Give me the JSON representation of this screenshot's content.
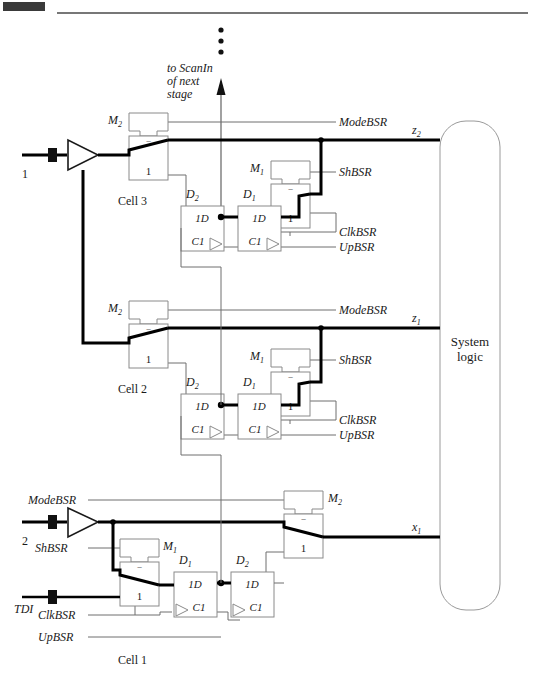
{
  "page": {
    "domain_note": "technical schematic"
  },
  "header_rule": {
    "present": true
  },
  "annotations": {
    "scan_out_line1": "to ScanIn",
    "scan_out_line2": "of next",
    "scan_out_line3": "stage",
    "vertical_ellipsis": "⋮"
  },
  "system_logic": {
    "label_line1": "System",
    "label_line2": "logic"
  },
  "cells": [
    {
      "id": "cell3",
      "name": "Cell 3",
      "input_pin": "1",
      "mux_out": {
        "label": "M",
        "sub": "2"
      },
      "mux_in": {
        "label": "M",
        "sub": "1"
      },
      "ff_far": {
        "label": "D",
        "sub": "2"
      },
      "ff_near": {
        "label": "D",
        "sub": "1"
      },
      "output_net": {
        "label": "z",
        "sub": "2"
      },
      "signals": [
        "ModeBSR",
        "ShBSR",
        "ClkBSR",
        "UpBSR"
      ],
      "mux_sel_top": "‾",
      "mux_sel_bot": "1",
      "ff_data_label": "1D",
      "ff_clk_label": "C1"
    },
    {
      "id": "cell2",
      "name": "Cell 2",
      "input_pin": "",
      "mux_out": {
        "label": "M",
        "sub": "2"
      },
      "mux_in": {
        "label": "M",
        "sub": "1"
      },
      "ff_far": {
        "label": "D",
        "sub": "2"
      },
      "ff_near": {
        "label": "D",
        "sub": "1"
      },
      "output_net": {
        "label": "z",
        "sub": "1"
      },
      "signals": [
        "ModeBSR",
        "ShBSR",
        "ClkBSR",
        "UpBSR"
      ],
      "mux_sel_top": "‾",
      "mux_sel_bot": "1",
      "ff_data_label": "1D",
      "ff_clk_label": "C1"
    },
    {
      "id": "cell1",
      "name": "Cell 1",
      "input_pin": "2",
      "scan_in_pin": "TDI",
      "mux_out": {
        "label": "M",
        "sub": "2"
      },
      "mux_in": {
        "label": "M",
        "sub": "1"
      },
      "ff_far": {
        "label": "D",
        "sub": "2"
      },
      "ff_near": {
        "label": "D",
        "sub": "1"
      },
      "output_net": {
        "label": "x",
        "sub": "1"
      },
      "signals": [
        "ModeBSR",
        "ShBSR",
        "ClkBSR",
        "UpBSR"
      ],
      "mux_sel_top": "‾",
      "mux_sel_bot": "1",
      "ff_data_label": "1D",
      "ff_clk_label": "C1"
    }
  ],
  "labels": {
    "mode_bsr": "ModeBSR",
    "sh_bsr": "ShBSR",
    "clk_bsr": "ClkBSR",
    "up_bsr": "UpBSR",
    "tdi": "TDI",
    "pin_1": "1",
    "pin_2": "2",
    "m1": "M",
    "m2": "M",
    "d1": "D",
    "d2": "D",
    "sub1": "1",
    "sub2": "2",
    "z1_base": "z",
    "z2_base": "z",
    "x1_base": "x",
    "cell1": "Cell 1",
    "cell2": "Cell 2",
    "cell3": "Cell 3",
    "one": "1",
    "oneD": "1D",
    "C1": "C1",
    "bar": "‾",
    "system": "System",
    "logic": "logic"
  },
  "colors": {
    "ink": "#1a1a1a",
    "thin_line": "#6e6e6e",
    "bold_line": "#000000",
    "box_stroke": "#8a8a8a",
    "background": "#ffffff",
    "header_rule": "#4a4a4a",
    "corner_block": "#3a3a3a"
  }
}
